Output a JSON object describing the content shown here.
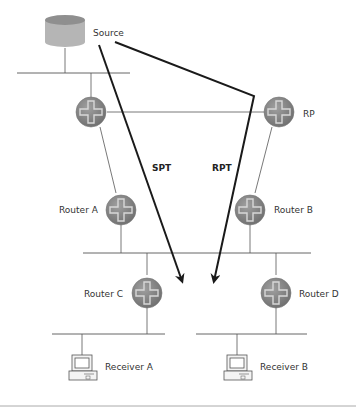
{
  "diagram": {
    "type": "multicast-network-topology",
    "nodes": {
      "source": {
        "label": "Source",
        "icon": "database-icon"
      },
      "rp": {
        "label": "RP",
        "icon": "router-icon"
      },
      "top_router": {
        "label": "",
        "icon": "router-icon"
      },
      "router_a": {
        "label": "Router A",
        "icon": "router-icon"
      },
      "router_b": {
        "label": "Router B",
        "icon": "router-icon"
      },
      "router_c": {
        "label": "Router C",
        "icon": "router-icon"
      },
      "router_d": {
        "label": "Router D",
        "icon": "router-icon"
      },
      "receiver_a": {
        "label": "Receiver A",
        "icon": "computer-icon"
      },
      "receiver_b": {
        "label": "Receiver B",
        "icon": "computer-icon"
      }
    },
    "paths": {
      "spt": {
        "label": "SPT",
        "description": "Shortest path tree from Source"
      },
      "rpt": {
        "label": "RPT",
        "description": "Rendezvous point tree via RP"
      }
    },
    "colors": {
      "router_fill": "#8a8a8a",
      "router_cross": "#d0d0d0",
      "database_fill": "#b8b8b8",
      "path_stroke": "#1a1a1a",
      "link_stroke": "#555555"
    }
  }
}
